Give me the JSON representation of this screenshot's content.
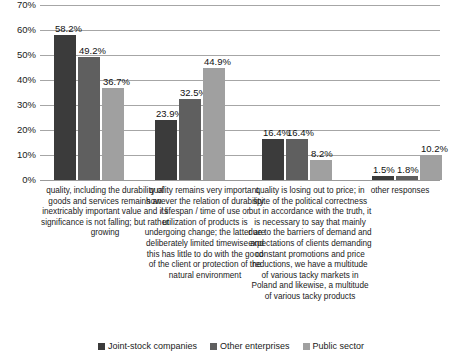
{
  "chart_data": {
    "type": "bar",
    "title": "",
    "xlabel": "",
    "ylabel": "",
    "ylim": [
      0,
      70
    ],
    "grid": true,
    "legend_position": "bottom",
    "ytick_labels": [
      "70%",
      "60%",
      "50%",
      "40%",
      "30%",
      "20%",
      "10%",
      "0%"
    ],
    "ytick_values": [
      70,
      60,
      50,
      40,
      30,
      20,
      10,
      0
    ],
    "categories": [
      "quality, including the durability of goods and services remains an inextricably important value and its significance is not falling; but rather growing",
      "quality remains very important, however the relation of durability / lifespan / time of use or utilization of products is undergoing change; the latter are deliberately limited timewise and this has little to do with the good of the client or protection of the natural environment",
      "quality is losing out to price; in spite of the political correctness but in accordance with the truth, it is necessary to say that mainly due to the barriers of demand and expectations of clients demanding constant promotions and price reductions, we have a multitude of various tacky markets in Poland and likewise, a multitude of various tacky products",
      "other responses"
    ],
    "series": [
      {
        "name": "Joint-stock companies",
        "color": "#3b3b3b",
        "values": [
          58.2,
          23.9,
          16.4,
          1.5
        ],
        "labels": [
          "58.2%",
          "23.9%",
          "16.4%",
          "1.5%"
        ]
      },
      {
        "name": "Other enterprises",
        "color": "#5f5f5f",
        "values": [
          49.2,
          32.5,
          16.4,
          1.8
        ],
        "labels": [
          "49.2%",
          "32.5%",
          "16.4%",
          "1.8%"
        ]
      },
      {
        "name": "Public sector",
        "color": "#a0a0a0",
        "values": [
          36.7,
          44.9,
          8.2,
          10.2
        ],
        "labels": [
          "36.7%",
          "44.9%",
          "8.2%",
          "10.2%"
        ]
      }
    ]
  }
}
